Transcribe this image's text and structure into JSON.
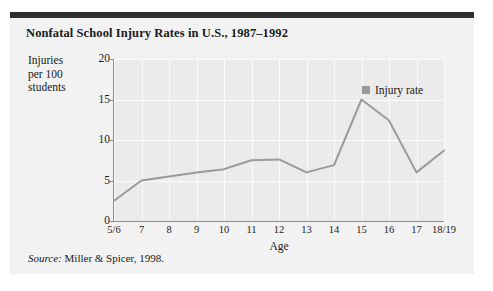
{
  "figure": {
    "title": "Nonfatal School Injury Rates in U.S., 1987–1992",
    "source_prefix": "Source:",
    "source_text": " Miller & Spicer, 1998.",
    "panel_background": "#f2f2f2",
    "top_rule_color": "#2e2e2e",
    "plot_background": "#ebebeb",
    "grid_color": "#fbfbfb",
    "axis_color": "#8d8d8d",
    "series_color": "#9a9a9a"
  },
  "chart_data": {
    "type": "line",
    "title": "Nonfatal School Injury Rates in U.S., 1987–1992",
    "xlabel": "Age",
    "ylabel": "Injuries per 100 students",
    "ylabel_lines": [
      "Injuries",
      "per 100",
      "students"
    ],
    "categories": [
      "5/6",
      "7",
      "8",
      "9",
      "10",
      "11",
      "12",
      "13",
      "14",
      "15",
      "16",
      "17",
      "18/19"
    ],
    "series": [
      {
        "name": "Injury rate",
        "color": "#9a9a9a",
        "values": [
          2.5,
          5.0,
          5.5,
          6.0,
          6.4,
          7.5,
          7.6,
          6.0,
          6.9,
          15.0,
          12.4,
          6.0,
          8.7
        ]
      }
    ],
    "ylim": [
      0,
      20
    ],
    "yticks": [
      0,
      5,
      10,
      15,
      20
    ],
    "ytick_labels": [
      "0",
      "5",
      "10",
      "15",
      "20"
    ],
    "grid": true,
    "legend_position": "top-right",
    "legend_entries": [
      "Injury rate"
    ]
  }
}
